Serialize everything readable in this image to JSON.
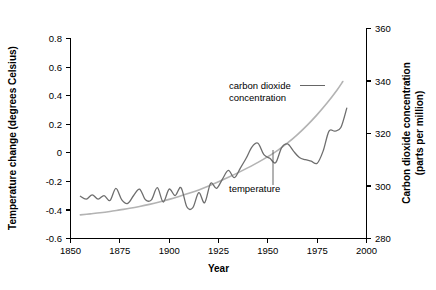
{
  "chart_data": {
    "type": "line",
    "title": "",
    "xlabel": "Year",
    "ylabel": "Temperature change (degrees Celsius)",
    "y2label": "Carbon dioxide concentration (parts per million)",
    "y2label_line1": "Carbon dioxide concentration",
    "y2label_line2": "(parts per million)",
    "xlim": [
      1850,
      2000
    ],
    "ylim": [
      -0.6,
      0.8
    ],
    "y2lim": [
      280,
      360
    ],
    "xticks": [
      1850,
      1875,
      1900,
      1925,
      1950,
      1975,
      2000
    ],
    "xtick_labels": [
      "1850",
      "1875",
      "1900",
      "1925",
      "1950",
      "1975",
      "2000"
    ],
    "yticks": [
      -0.6,
      -0.4,
      -0.2,
      0,
      0.2,
      0.4,
      0.6,
      0.8
    ],
    "ytick_labels": [
      "-0.6",
      "-0.4",
      "-0.2",
      "0",
      "0.2",
      "0.4",
      "0.6",
      "0.8"
    ],
    "y2ticks": [
      280,
      300,
      320,
      340,
      360
    ],
    "y2tick_labels": [
      "280",
      "300",
      "320",
      "340",
      "360"
    ],
    "grid": false,
    "legend_position": "inline-annotations",
    "annotations": [
      {
        "name": "carbon-dioxide-concentration",
        "text_line1": "carbon dioxide",
        "text_line2": "concentration",
        "target_year": 1985,
        "color": "#b3b3b3"
      },
      {
        "name": "temperature",
        "text_line1": "temperature",
        "target_year": 1955,
        "color": "#6e6e6e"
      }
    ],
    "series": [
      {
        "name": "carbon dioxide concentration",
        "axis": "right",
        "units": "parts per million",
        "color": "#b3b3b3",
        "x": [
          1855,
          1860,
          1865,
          1870,
          1875,
          1880,
          1885,
          1890,
          1895,
          1900,
          1905,
          1910,
          1915,
          1920,
          1925,
          1930,
          1935,
          1940,
          1945,
          1950,
          1955,
          1960,
          1965,
          1970,
          1975,
          1980,
          1985,
          1988
        ],
        "values": [
          289.0,
          289.4,
          289.8,
          290.3,
          290.9,
          291.5,
          292.2,
          293.0,
          293.9,
          294.9,
          296.0,
          297.2,
          298.5,
          300.0,
          301.6,
          303.3,
          305.1,
          307.0,
          309.0,
          311.2,
          313.6,
          316.4,
          319.6,
          323.2,
          327.2,
          331.6,
          336.5,
          339.8
        ]
      },
      {
        "name": "temperature",
        "axis": "left",
        "units": "degrees Celsius",
        "color": "#6e6e6e",
        "x": [
          1855,
          1858,
          1861,
          1864,
          1867,
          1870,
          1873,
          1876,
          1879,
          1882,
          1885,
          1888,
          1891,
          1894,
          1897,
          1900,
          1903,
          1906,
          1909,
          1912,
          1915,
          1918,
          1921,
          1924,
          1927,
          1930,
          1933,
          1936,
          1939,
          1942,
          1945,
          1948,
          1951,
          1954,
          1957,
          1960,
          1963,
          1966,
          1969,
          1972,
          1975,
          1978,
          1981,
          1984,
          1987,
          1990
        ],
        "values": [
          -0.305,
          -0.325,
          -0.295,
          -0.325,
          -0.3,
          -0.335,
          -0.25,
          -0.33,
          -0.355,
          -0.3,
          -0.255,
          -0.33,
          -0.33,
          -0.245,
          -0.345,
          -0.255,
          -0.3,
          -0.245,
          -0.38,
          -0.385,
          -0.28,
          -0.35,
          -0.215,
          -0.25,
          -0.185,
          -0.125,
          -0.175,
          -0.11,
          -0.04,
          0.04,
          0.065,
          -0.015,
          -0.04,
          -0.07,
          0.035,
          0.06,
          0.01,
          -0.035,
          -0.05,
          -0.06,
          -0.075,
          0.01,
          0.15,
          0.15,
          0.175,
          0.31
        ]
      }
    ]
  }
}
